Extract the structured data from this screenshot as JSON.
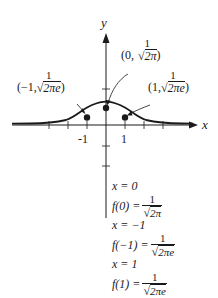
{
  "diagram": {
    "type": "function-graph",
    "function": "f(x) = (1/sqrt(2π)) e^(-x²/2)",
    "axes": {
      "x_label": "x",
      "y_label": "y",
      "x_tick_labels": [
        "-1",
        "1"
      ],
      "color": "#1a1a1a"
    },
    "points": [
      {
        "name": "left-inflection",
        "x_text": "(−1,",
        "numerator": "1",
        "sqrt_arg": "2πe",
        "close": ")"
      },
      {
        "name": "peak",
        "x_text": "(0,",
        "numerator": "1",
        "sqrt_arg": "2π",
        "close": ")"
      },
      {
        "name": "right-inflection",
        "x_text": "(1,",
        "numerator": "1",
        "sqrt_arg": "2πe",
        "close": ")"
      }
    ],
    "equations": [
      {
        "lhs": "x = 0"
      },
      {
        "lhs": "f(0) =",
        "numerator": "1",
        "sqrt_arg": "2π"
      },
      {
        "lhs": "x = −1"
      },
      {
        "lhs": "f(−1) =",
        "numerator": "1",
        "sqrt_arg": "2πe"
      },
      {
        "lhs": "x = 1"
      },
      {
        "lhs": "f(1) =",
        "numerator": "1",
        "sqrt_arg": "2πe"
      }
    ],
    "radical_symbol": "√"
  }
}
